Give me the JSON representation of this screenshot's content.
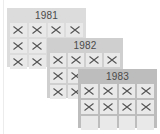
{
  "cards": [
    {
      "year": "1981",
      "bg": "#dcdcdc",
      "cells": [
        "x",
        "x",
        "x",
        "x",
        "x",
        "x",
        "none",
        "none",
        "x",
        "x",
        "none",
        "none"
      ]
    },
    {
      "year": "1982",
      "bg": "#cfcfcf",
      "cells": [
        "x",
        "x",
        "x",
        "x",
        "x",
        "x",
        "none",
        "none",
        "x",
        "x",
        "none",
        "none"
      ]
    },
    {
      "year": "1983",
      "bg": "#bdbdbd",
      "cells": [
        "x",
        "x",
        "x",
        "x",
        "x",
        "x",
        "x",
        "x",
        "empty",
        "empty",
        "empty",
        "empty"
      ]
    }
  ],
  "colors": {
    "cross": "#555555",
    "cell": "#e9e9e9"
  }
}
